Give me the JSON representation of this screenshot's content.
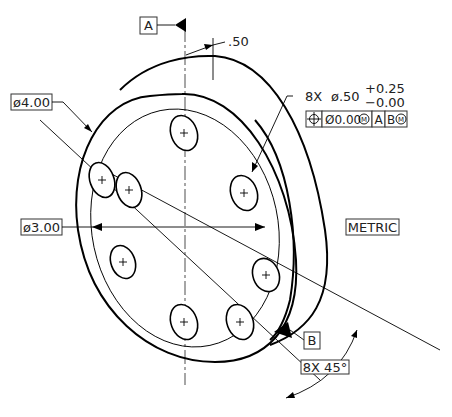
{
  "drawing": {
    "datum_a": {
      "label": "A"
    },
    "datum_b": {
      "label": "B"
    },
    "thickness": {
      "value": ".50"
    },
    "outer_diameter": {
      "label": "ø4.00"
    },
    "bolt_circle_diameter": {
      "label": "ø3.00"
    },
    "hole_callout": {
      "count": "8X",
      "diameter": "ø.50",
      "tol_plus": "+0.25",
      "tol_minus": "−0.00"
    },
    "feature_control_frame": {
      "symbol": "⌖",
      "tolerance": "Ø0.00",
      "tolerance_modifier": "M",
      "datum_primary": "A",
      "datum_secondary": "B",
      "datum_secondary_modifier": "M"
    },
    "units_note": "METRIC",
    "angle_callout": "8X  45°"
  }
}
